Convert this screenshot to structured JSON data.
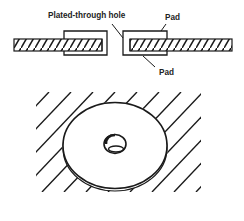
{
  "diagram": {
    "cross_section": {
      "labels": {
        "hole": "Plated-through hole",
        "pad_top": "Pad",
        "pad_bottom": "Pad"
      }
    },
    "perspective_view": {
      "description": "Circular pad with central hole on hatched board"
    },
    "colors": {
      "ink": "#1a1a1a",
      "background": "#ffffff"
    }
  }
}
